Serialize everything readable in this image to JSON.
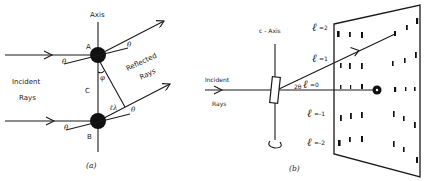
{
  "panel_a": {
    "caption": "(a)",
    "axis_label": "Axis",
    "atom_top_label": "A",
    "atom_bottom_label": "B",
    "spacing_label": "C",
    "incident_label_line1": "Incident",
    "incident_label_line2": "Rays",
    "reflected_label_line1": "Reflected",
    "reflected_label_line2": "Rays",
    "angle_theta": "θ",
    "angle_phi": "φ",
    "path_label": "ℓλ"
  },
  "panel_b": {
    "caption": "(b)",
    "axis_label": "c - Axis",
    "incident_label_line1": "Incident",
    "incident_label_line2": "Rays",
    "angle_label": "2θ",
    "layer_lines": [
      {
        "symbol": "ℓ",
        "value": "=2"
      },
      {
        "symbol": "ℓ",
        "value": "=1"
      },
      {
        "symbol": "ℓ",
        "value": "=0"
      },
      {
        "symbol": "ℓ",
        "value": "=-1"
      },
      {
        "symbol": "ℓ",
        "value": "=-2"
      }
    ]
  }
}
